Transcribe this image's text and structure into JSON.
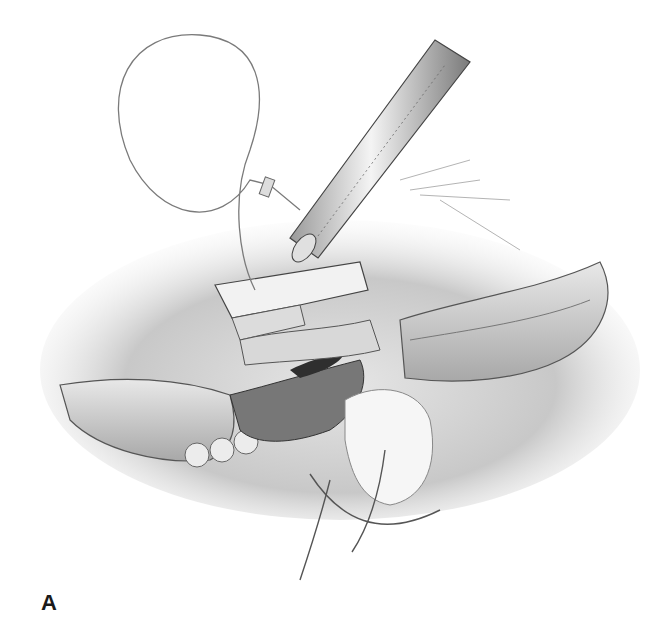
{
  "figure": {
    "panel_label": "A",
    "colors": {
      "background": "#ffffff",
      "ink_dark": "#3a3a3a",
      "ink_mid": "#8a8a8a",
      "ink_light": "#d0d0d0"
    }
  }
}
